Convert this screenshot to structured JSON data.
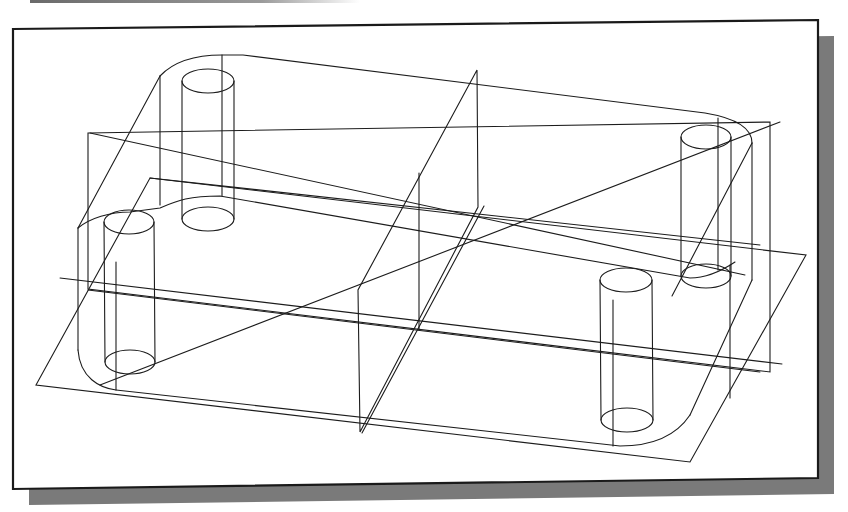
{
  "figure": {
    "type": "cad-wireframe-isometric",
    "colors": {
      "line": "#1c1c1c",
      "frame_border": "#1a1a1a",
      "shadow": "#7a7a7a",
      "background": "#ffffff"
    },
    "viewport": {
      "frame": [
        [
          13,
          29
        ],
        [
          818,
          20
        ],
        [
          818,
          478
        ],
        [
          13,
          489
        ]
      ],
      "shadow_offset": [
        16,
        16
      ]
    },
    "parts": {
      "plate": {
        "top_outline": "M243,55 L705,120 C735,124 752,135 752,150 L752,170 M752,175 C752,262 747,275 745,275 M700,278 C690,283 680,288 672,295 M176,205 C160,210 130,212 100,212 C80,214 78,225 78,232",
        "bottom_outline": "M78,370 C80,385 100,390 115,392 L595,430 L620,433 C660,435 690,420 690,415",
        "rounded_corners": [
          "M243,55 C205,55 178,62 160,76",
          "M705,120 C725,122 752,130 752,150",
          "M78,232 C78,245 90,252 100,255",
          "M690,415 C700,410 705,398 705,390"
        ],
        "vertical_edges": [
          [
            160,
            76,
            160,
            205
          ],
          [
            752,
            150,
            752,
            275
          ],
          [
            78,
            232,
            78,
            370
          ],
          [
            705,
            280,
            705,
            390
          ]
        ]
      },
      "cylinders": [
        {
          "name": "post-back-left",
          "cx": 208,
          "top_cy": 81,
          "bottom_cy": 220,
          "rx": 26,
          "ry": 12
        },
        {
          "name": "post-back-right",
          "cx": 705,
          "top_cy": 137,
          "bottom_cy": 278,
          "rx": 26,
          "ry": 12
        },
        {
          "name": "post-front-left",
          "cx": 129,
          "top_cy": 222,
          "bottom_cy": 361,
          "rx": 26,
          "ry": 12
        },
        {
          "name": "post-front-right",
          "cx": 626,
          "top_cy": 278,
          "bottom_cy": 421,
          "rx": 26,
          "ry": 12
        }
      ],
      "datum_planes": [
        {
          "name": "horizontal-plane",
          "points": [
            [
              40,
              370
            ],
            [
              150,
              178
            ],
            [
              805,
              257
            ],
            [
              688,
              460
            ]
          ]
        },
        {
          "name": "front-plane",
          "points": [
            [
              88,
              133
            ],
            [
              754,
              212
            ],
            [
              754,
              372
            ],
            [
              88,
              291
            ]
          ]
        },
        {
          "name": "side-plane",
          "points": [
            [
              476,
              70
            ],
            [
              480,
              205
            ],
            [
              360,
              430
            ],
            [
              358,
              290
            ]
          ]
        }
      ],
      "extra_lines": [
        [
          60,
          278,
          782,
          364
        ],
        [
          88,
          133,
          770,
          120
        ],
        [
          36,
          225,
          803,
          257
        ],
        [
          100,
          390,
          780,
          120
        ],
        [
          420,
          175,
          420,
          330
        ],
        [
          476,
          70,
          360,
          290
        ],
        [
          486,
          206,
          360,
          433
        ],
        [
          478,
          209,
          356,
          430
        ],
        [
          100,
          360,
          420,
          326
        ],
        [
          420,
          326,
          745,
          275
        ]
      ]
    }
  }
}
